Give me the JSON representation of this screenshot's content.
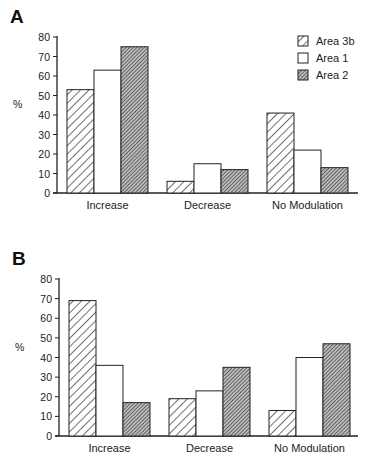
{
  "chart_data": [
    {
      "type": "bar",
      "panel": "A",
      "title": "",
      "xlabel": "",
      "ylabel": "%",
      "ylim": [
        0,
        80
      ],
      "yticks": [
        0,
        10,
        20,
        30,
        40,
        50,
        60,
        70,
        80
      ],
      "categories": [
        "Increase",
        "Decrease",
        "No Modulation"
      ],
      "series": [
        {
          "name": "Area 3b",
          "pattern": "hatch-wide",
          "values": [
            53,
            6,
            41
          ]
        },
        {
          "name": "Area 1",
          "pattern": "open",
          "values": [
            63,
            15,
            22
          ]
        },
        {
          "name": "Area 2",
          "pattern": "hatch-dense",
          "values": [
            75,
            12,
            13
          ]
        }
      ],
      "legend": {
        "position": "top-right",
        "entries": [
          "Area 3b",
          "Area 1",
          "Area 2"
        ]
      },
      "grid": false
    },
    {
      "type": "bar",
      "panel": "B",
      "title": "",
      "xlabel": "",
      "ylabel": "%",
      "ylim": [
        0,
        80
      ],
      "yticks": [
        0,
        10,
        20,
        30,
        40,
        50,
        60,
        70,
        80
      ],
      "categories": [
        "Increase",
        "Decrease",
        "No Modulation"
      ],
      "series": [
        {
          "name": "Area 3b",
          "pattern": "hatch-wide",
          "values": [
            69,
            19,
            13
          ]
        },
        {
          "name": "Area 1",
          "pattern": "open",
          "values": [
            36,
            23,
            40
          ]
        },
        {
          "name": "Area 2",
          "pattern": "hatch-dense",
          "values": [
            17,
            35,
            47
          ]
        }
      ],
      "legend": null,
      "grid": false
    }
  ],
  "panels": {
    "a": {
      "label": "A",
      "ylabel": "%"
    },
    "b": {
      "label": "B",
      "ylabel": "%"
    }
  },
  "legend": {
    "items": [
      {
        "label": "Area 3b"
      },
      {
        "label": "Area 1"
      },
      {
        "label": "Area 2"
      }
    ]
  }
}
